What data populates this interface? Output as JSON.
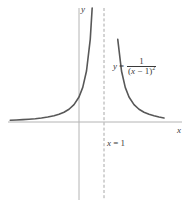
{
  "figure": {
    "background_color": "#ffffff",
    "width": 189,
    "height": 209
  },
  "labels": {
    "y_axis": "y",
    "x_axis": "x",
    "asymptote_var": "x",
    "asymptote_eq": " = 1",
    "equation_lhs": "y",
    "equation_eq": "=",
    "equation_numerator": "1",
    "equation_denominator_open": "(",
    "equation_denominator_var": "x",
    "equation_denominator_rest": " − 1)",
    "equation_denominator_exp": "2"
  },
  "colors": {
    "curve": "#585858",
    "axis": "#b4b4b4",
    "asymptote": "#a8a8a8",
    "text": "#3a3a3a"
  },
  "chart_data": {
    "type": "line",
    "title": "",
    "subtitle": "",
    "xlabel": "x",
    "ylabel": "y",
    "function": "y = 1/(x - 1)^2",
    "grid": false,
    "legend": null,
    "annotations": [
      {
        "text": "y = 1/(x − 1)²",
        "kind": "equation-label"
      },
      {
        "text": "x = 1",
        "kind": "asymptote-label"
      }
    ],
    "asymptotes": {
      "vertical": [
        1
      ],
      "horizontal": [
        0
      ]
    },
    "axis_origin_px": {
      "x": 79,
      "y": 122
    },
    "asymptote_x_px": 104,
    "px_per_unit_x": 25,
    "px_per_unit_y": 25,
    "xlim": [
      -3.16,
      3.4
    ],
    "ylim": [
      -3.48,
      4.56
    ],
    "vertical_line_extent_px": {
      "top": 8,
      "bottom": 200
    },
    "x_axis_extent_px": {
      "left": 8,
      "right": 182
    },
    "series": [
      {
        "name": "left-branch",
        "x": [
          -3.2,
          -3.0,
          -2.75,
          -2.5,
          -2.25,
          -2.0,
          -1.75,
          -1.5,
          -1.25,
          -1.0,
          -0.8,
          -0.6,
          -0.4,
          -0.2,
          0.0,
          0.15,
          0.3,
          0.45,
          0.55,
          0.65,
          0.72,
          0.78,
          0.83,
          0.87,
          0.9,
          0.925,
          0.945,
          0.96
        ],
        "y": [
          0.057,
          0.063,
          0.071,
          0.082,
          0.095,
          0.111,
          0.132,
          0.16,
          0.198,
          0.25,
          0.309,
          0.391,
          0.51,
          0.694,
          1.0,
          1.384,
          2.041,
          3.306,
          4.938,
          8.163,
          12.76,
          20.66,
          34.6,
          59.2,
          100.0,
          177.8,
          330.6,
          625.0
        ],
        "style": {
          "color": "#585858",
          "width": 1.6
        }
      },
      {
        "name": "right-branch",
        "x": [
          1.04,
          1.055,
          1.075,
          1.1,
          1.13,
          1.17,
          1.22,
          1.28,
          1.35,
          1.45,
          1.55,
          1.7,
          1.85,
          2.0,
          2.2,
          2.4,
          2.6,
          2.8,
          3.0,
          3.2,
          3.4
        ],
        "y": [
          625.0,
          330.6,
          177.8,
          100.0,
          59.2,
          34.6,
          20.66,
          12.76,
          8.163,
          4.938,
          3.306,
          2.041,
          1.384,
          1.0,
          0.694,
          0.51,
          0.391,
          0.309,
          0.25,
          0.198,
          0.16
        ],
        "style": {
          "color": "#585858",
          "width": 1.6
        }
      }
    ]
  }
}
